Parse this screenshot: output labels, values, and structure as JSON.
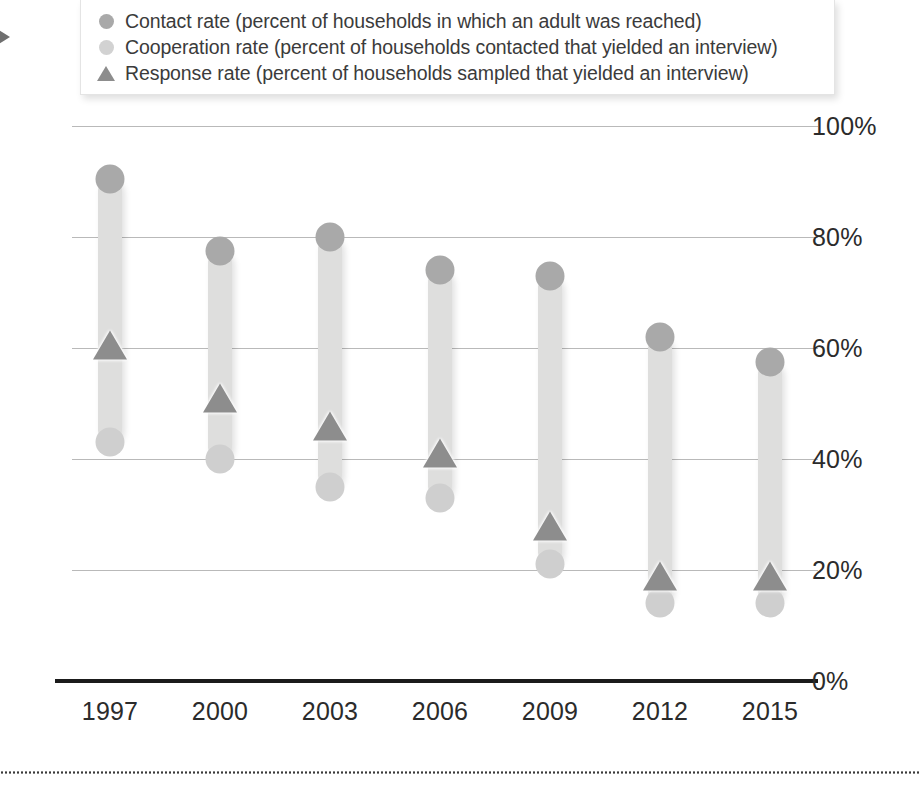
{
  "edge_marker": {
    "name": "right-arrow"
  },
  "legend": {
    "position": "top",
    "entries": [
      {
        "marker": "dark-gray-circle",
        "label": "Contact rate (percent of households in which an adult was reached)"
      },
      {
        "marker": "light-gray-circle",
        "label": "Cooperation rate (percent of households contacted that yielded an interview)"
      },
      {
        "marker": "gray-triangle",
        "label": "Response rate (percent of households sampled that yielded an interview)"
      }
    ]
  },
  "colors": {
    "contact": "#a9a9a9",
    "cooperation": "#cfcfcf",
    "response": "#8d8d8d",
    "bar": "#dededd",
    "gridline": "#b9b9b9",
    "axis": "#1b1b1b",
    "text": "#2b2b2b"
  },
  "chart_data": {
    "type": "line",
    "title": "",
    "subtitle": "",
    "xlabel": "",
    "ylabel": "",
    "ylim": [
      0,
      100
    ],
    "yticks": [
      0,
      20,
      40,
      60,
      80,
      100
    ],
    "ytick_labels": [
      "0%",
      "20%",
      "40%",
      "60%",
      "80%",
      "100%"
    ],
    "grid": true,
    "legend_position": "top",
    "categories": [
      "1997",
      "2000",
      "2003",
      "2006",
      "2009",
      "2012",
      "2015"
    ],
    "series": [
      {
        "name": "Contact rate (percent of households in which an adult was reached)",
        "short_name": "Contact rate",
        "marker": "circle",
        "color": "#a9a9a9",
        "values": [
          90.5,
          77.5,
          80,
          74,
          73,
          62,
          57.5
        ]
      },
      {
        "name": "Cooperation rate (percent of households contacted that yielded an interview)",
        "short_name": "Cooperation rate",
        "marker": "circle",
        "color": "#cfcfcf",
        "values": [
          43,
          40,
          35,
          33,
          21,
          14,
          14
        ]
      },
      {
        "name": "Response rate (percent of households sampled that yielded an interview)",
        "short_name": "Response rate",
        "marker": "triangle",
        "color": "#8d8d8d",
        "values": [
          60.5,
          51,
          46,
          41,
          28,
          19,
          19
        ]
      }
    ]
  }
}
